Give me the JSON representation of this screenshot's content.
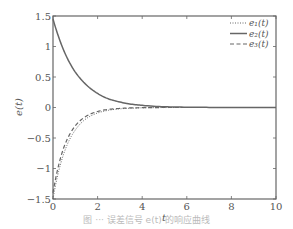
{
  "chart_data": {
    "type": "line",
    "title": "",
    "xlabel": "t",
    "ylabel": "e(t)",
    "xlim": [
      0,
      10
    ],
    "ylim": [
      -1.5,
      1.5
    ],
    "xticks": [
      0,
      2,
      4,
      6,
      8,
      10
    ],
    "yticks": [
      1.5,
      1,
      0.5,
      0,
      -0.5,
      -1,
      -1.5
    ],
    "xtick_labels": [
      "0",
      "2",
      "4",
      "6",
      "8",
      "10"
    ],
    "ytick_labels": [
      "1.5",
      "1",
      "0.5",
      "0",
      "−0.5",
      "−1",
      "−1.5"
    ],
    "grid": false,
    "legend_position": "upper right",
    "x": [
      0,
      0.25,
      0.5,
      0.75,
      1,
      1.5,
      2,
      2.5,
      3,
      3.5,
      4,
      5,
      6,
      7,
      8,
      9,
      10
    ],
    "series": [
      {
        "name": "e1(t)",
        "legend_label": "e₁(t)",
        "style": "dotted",
        "values": [
          -1.5,
          -1.05,
          -0.74,
          -0.52,
          -0.37,
          -0.18,
          -0.09,
          -0.045,
          -0.022,
          -0.011,
          -0.005,
          -0.001,
          0,
          0,
          0,
          0,
          0
        ]
      },
      {
        "name": "e2(t)",
        "legend_label": "e₂(t)",
        "style": "solid",
        "values": [
          1.45,
          1.16,
          0.92,
          0.73,
          0.58,
          0.37,
          0.23,
          0.14,
          0.09,
          0.055,
          0.035,
          0.012,
          0.005,
          0.002,
          0.001,
          0,
          0
        ]
      },
      {
        "name": "e3(t)",
        "legend_label": "e₃(t)",
        "style": "dashed",
        "values": [
          -1.4,
          -0.95,
          -0.64,
          -0.44,
          -0.3,
          -0.14,
          -0.065,
          -0.03,
          -0.015,
          -0.007,
          -0.003,
          0,
          0,
          0,
          0,
          0,
          0
        ]
      }
    ],
    "line_color": "#666666"
  },
  "caption": "图 ··· 误差信号 e(t) 的响应曲线"
}
